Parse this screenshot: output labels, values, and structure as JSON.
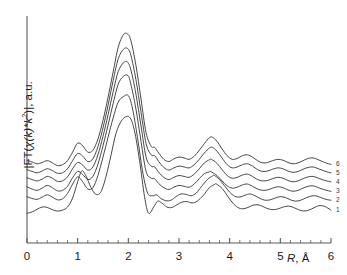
{
  "chart_data": {
    "type": "line",
    "title": "",
    "subtitle": "",
    "xlabel": "R, Å",
    "ylabel": "|FT(χ(k)*k²)|, a.u.",
    "xlim": [
      0,
      6
    ],
    "ylim": [
      0,
      1
    ],
    "grid": false,
    "legend_position": "right-inline",
    "xticks": [
      0,
      1,
      2,
      3,
      4,
      5,
      6
    ],
    "xtick_labels": [
      "0",
      "1",
      "2",
      "3",
      "4",
      "5",
      "6"
    ],
    "xminor_tick_step": 0.2,
    "yticks": [],
    "ytick_labels": [],
    "yaxis_values_shown": false,
    "line_color": "#333333",
    "line_width": 0.9,
    "axis_color": "#555555",
    "background": "#ffffff",
    "note": "Six vertically offset EXAFS Fourier-transform magnitude curves; dominant first-shell peak near R = 2.0 A and second-shell peak near R = 3.65 A",
    "series": [
      {
        "name": "6",
        "label": "6",
        "baseline_offset": 0.345,
        "peak1_R": 1.98,
        "peak1_height": 0.93,
        "peak2_R": 3.66,
        "peak2_height": 0.47,
        "x": [
          0.0,
          0.1,
          0.2,
          0.3,
          0.4,
          0.5,
          0.6,
          0.7,
          0.8,
          0.9,
          1.0,
          1.1,
          1.2,
          1.3,
          1.4,
          1.5,
          1.6,
          1.7,
          1.8,
          1.9,
          1.98,
          2.05,
          2.15,
          2.25,
          2.35,
          2.45,
          2.52,
          2.6,
          2.7,
          2.8,
          2.9,
          3.0,
          3.1,
          3.2,
          3.3,
          3.4,
          3.5,
          3.6,
          3.66,
          3.75,
          3.85,
          3.95,
          4.05,
          4.15,
          4.25,
          4.35,
          4.45,
          4.55,
          4.65,
          4.75,
          4.85,
          4.95,
          5.05,
          5.15,
          5.25,
          5.35,
          5.45,
          5.55,
          5.65,
          5.75,
          5.85,
          5.95,
          6.0
        ],
        "y": [
          0.368,
          0.36,
          0.352,
          0.358,
          0.366,
          0.356,
          0.344,
          0.348,
          0.366,
          0.404,
          0.444,
          0.432,
          0.404,
          0.412,
          0.462,
          0.545,
          0.648,
          0.76,
          0.87,
          0.925,
          0.93,
          0.9,
          0.79,
          0.64,
          0.49,
          0.43,
          0.425,
          0.4,
          0.372,
          0.362,
          0.374,
          0.382,
          0.378,
          0.372,
          0.386,
          0.412,
          0.442,
          0.468,
          0.47,
          0.452,
          0.418,
          0.388,
          0.372,
          0.376,
          0.388,
          0.392,
          0.382,
          0.366,
          0.356,
          0.358,
          0.366,
          0.372,
          0.368,
          0.358,
          0.352,
          0.356,
          0.366,
          0.376,
          0.378,
          0.37,
          0.36,
          0.352,
          0.35
        ]
      },
      {
        "name": "5",
        "label": "5",
        "baseline_offset": 0.312,
        "peak1_R": 1.98,
        "peak1_height": 0.865,
        "peak2_R": 3.66,
        "peak2_height": 0.425,
        "x": [
          0.0,
          0.1,
          0.2,
          0.3,
          0.4,
          0.5,
          0.6,
          0.7,
          0.8,
          0.9,
          1.0,
          1.1,
          1.2,
          1.3,
          1.4,
          1.5,
          1.6,
          1.7,
          1.8,
          1.9,
          1.98,
          2.05,
          2.15,
          2.25,
          2.35,
          2.45,
          2.52,
          2.6,
          2.7,
          2.8,
          2.9,
          3.0,
          3.1,
          3.2,
          3.3,
          3.4,
          3.5,
          3.6,
          3.66,
          3.75,
          3.85,
          3.95,
          4.05,
          4.15,
          4.25,
          4.35,
          4.45,
          4.55,
          4.65,
          4.75,
          4.85,
          4.95,
          5.05,
          5.15,
          5.25,
          5.35,
          5.45,
          5.55,
          5.65,
          5.75,
          5.85,
          5.95,
          6.0
        ],
        "y": [
          0.326,
          0.318,
          0.312,
          0.32,
          0.33,
          0.322,
          0.31,
          0.312,
          0.33,
          0.366,
          0.398,
          0.386,
          0.362,
          0.374,
          0.428,
          0.512,
          0.612,
          0.722,
          0.818,
          0.86,
          0.865,
          0.835,
          0.726,
          0.582,
          0.442,
          0.392,
          0.388,
          0.362,
          0.336,
          0.324,
          0.334,
          0.342,
          0.338,
          0.334,
          0.348,
          0.372,
          0.4,
          0.422,
          0.425,
          0.408,
          0.378,
          0.348,
          0.334,
          0.338,
          0.348,
          0.352,
          0.342,
          0.326,
          0.318,
          0.32,
          0.328,
          0.334,
          0.33,
          0.32,
          0.314,
          0.318,
          0.328,
          0.336,
          0.338,
          0.33,
          0.322,
          0.314,
          0.312
        ]
      },
      {
        "name": "4",
        "label": "4",
        "baseline_offset": 0.278,
        "peak1_R": 1.98,
        "peak1_height": 0.805,
        "peak2_R": 3.64,
        "peak2_height": 0.372,
        "x": [
          0.0,
          0.1,
          0.2,
          0.3,
          0.4,
          0.5,
          0.6,
          0.7,
          0.8,
          0.9,
          1.0,
          1.1,
          1.2,
          1.3,
          1.4,
          1.5,
          1.6,
          1.7,
          1.8,
          1.9,
          1.98,
          2.05,
          2.15,
          2.25,
          2.35,
          2.45,
          2.52,
          2.6,
          2.7,
          2.8,
          2.9,
          3.0,
          3.1,
          3.2,
          3.3,
          3.4,
          3.5,
          3.6,
          3.64,
          3.75,
          3.85,
          3.95,
          4.05,
          4.15,
          4.25,
          4.35,
          4.45,
          4.55,
          4.65,
          4.75,
          4.85,
          4.95,
          5.05,
          5.15,
          5.25,
          5.35,
          5.45,
          5.55,
          5.65,
          5.75,
          5.85,
          5.95,
          6.0
        ],
        "y": [
          0.29,
          0.282,
          0.276,
          0.284,
          0.296,
          0.288,
          0.274,
          0.276,
          0.294,
          0.33,
          0.358,
          0.346,
          0.324,
          0.338,
          0.392,
          0.474,
          0.57,
          0.672,
          0.762,
          0.8,
          0.805,
          0.77,
          0.662,
          0.52,
          0.382,
          0.342,
          0.338,
          0.314,
          0.292,
          0.282,
          0.292,
          0.3,
          0.296,
          0.292,
          0.306,
          0.33,
          0.356,
          0.37,
          0.372,
          0.354,
          0.326,
          0.3,
          0.288,
          0.292,
          0.302,
          0.306,
          0.296,
          0.282,
          0.276,
          0.278,
          0.286,
          0.292,
          0.288,
          0.278,
          0.272,
          0.276,
          0.286,
          0.294,
          0.296,
          0.288,
          0.28,
          0.274,
          0.272
        ]
      },
      {
        "name": "3",
        "label": "3",
        "baseline_offset": 0.236,
        "peak1_R": 1.99,
        "peak1_height": 0.745,
        "peak2_R": 3.62,
        "peak2_height": 0.318,
        "x": [
          0.0,
          0.1,
          0.2,
          0.3,
          0.4,
          0.5,
          0.6,
          0.7,
          0.8,
          0.9,
          1.0,
          1.1,
          1.2,
          1.3,
          1.4,
          1.5,
          1.6,
          1.7,
          1.8,
          1.9,
          1.99,
          2.05,
          2.15,
          2.25,
          2.35,
          2.45,
          2.52,
          2.6,
          2.7,
          2.8,
          2.9,
          3.0,
          3.1,
          3.2,
          3.3,
          3.4,
          3.5,
          3.6,
          3.62,
          3.75,
          3.85,
          3.95,
          4.05,
          4.15,
          4.25,
          4.35,
          4.45,
          4.55,
          4.65,
          4.75,
          4.85,
          4.95,
          5.05,
          5.15,
          5.25,
          5.35,
          5.45,
          5.55,
          5.65,
          5.75,
          5.85,
          5.95,
          6.0
        ],
        "y": [
          0.25,
          0.24,
          0.234,
          0.244,
          0.256,
          0.246,
          0.232,
          0.234,
          0.252,
          0.29,
          0.318,
          0.304,
          0.282,
          0.296,
          0.35,
          0.432,
          0.524,
          0.62,
          0.706,
          0.74,
          0.745,
          0.706,
          0.596,
          0.452,
          0.318,
          0.288,
          0.286,
          0.264,
          0.246,
          0.238,
          0.248,
          0.256,
          0.252,
          0.248,
          0.262,
          0.286,
          0.308,
          0.316,
          0.318,
          0.3,
          0.276,
          0.254,
          0.244,
          0.248,
          0.258,
          0.262,
          0.252,
          0.24,
          0.234,
          0.236,
          0.244,
          0.25,
          0.246,
          0.236,
          0.23,
          0.234,
          0.244,
          0.252,
          0.254,
          0.246,
          0.238,
          0.232,
          0.23
        ]
      },
      {
        "name": "2",
        "label": "2",
        "baseline_offset": 0.196,
        "peak1_R": 2.0,
        "peak1_height": 0.655,
        "peak2_R": 3.7,
        "peak2_height": 0.3,
        "x": [
          0.0,
          0.1,
          0.2,
          0.3,
          0.4,
          0.5,
          0.6,
          0.7,
          0.8,
          0.9,
          1.0,
          1.1,
          1.2,
          1.3,
          1.4,
          1.5,
          1.6,
          1.7,
          1.8,
          1.9,
          2.0,
          2.08,
          2.18,
          2.28,
          2.38,
          2.48,
          2.56,
          2.64,
          2.74,
          2.84,
          2.94,
          3.04,
          3.14,
          3.24,
          3.34,
          3.44,
          3.56,
          3.66,
          3.7,
          3.8,
          3.9,
          4.0,
          4.1,
          4.2,
          4.3,
          4.4,
          4.5,
          4.6,
          4.7,
          4.8,
          4.9,
          5.0,
          5.1,
          5.2,
          5.3,
          5.4,
          5.5,
          5.6,
          5.7,
          5.8,
          5.9,
          6.0
        ],
        "y": [
          0.206,
          0.198,
          0.194,
          0.204,
          0.214,
          0.204,
          0.192,
          0.196,
          0.22,
          0.262,
          0.294,
          0.272,
          0.24,
          0.246,
          0.3,
          0.382,
          0.47,
          0.556,
          0.626,
          0.65,
          0.655,
          0.6,
          0.47,
          0.32,
          0.222,
          0.21,
          0.214,
          0.198,
          0.188,
          0.19,
          0.206,
          0.218,
          0.216,
          0.21,
          0.222,
          0.25,
          0.282,
          0.298,
          0.3,
          0.282,
          0.254,
          0.226,
          0.208,
          0.204,
          0.212,
          0.218,
          0.21,
          0.198,
          0.19,
          0.192,
          0.2,
          0.206,
          0.202,
          0.192,
          0.186,
          0.19,
          0.2,
          0.208,
          0.21,
          0.202,
          0.194,
          0.19
        ]
      },
      {
        "name": "1",
        "label": "1",
        "baseline_offset": 0.152,
        "peak1_R": 2.02,
        "peak1_height": 0.56,
        "peak2_R": 3.74,
        "peak2_height": 0.262,
        "x": [
          0.0,
          0.1,
          0.2,
          0.3,
          0.4,
          0.5,
          0.6,
          0.7,
          0.8,
          0.9,
          1.0,
          1.08,
          1.16,
          1.26,
          1.36,
          1.46,
          1.56,
          1.66,
          1.76,
          1.88,
          2.02,
          2.12,
          2.22,
          2.32,
          2.4,
          2.5,
          2.58,
          2.66,
          2.76,
          2.86,
          2.96,
          3.06,
          3.16,
          3.26,
          3.36,
          3.48,
          3.6,
          3.7,
          3.74,
          3.86,
          3.96,
          4.06,
          4.16,
          4.26,
          4.36,
          4.46,
          4.56,
          4.66,
          4.76,
          4.86,
          4.96,
          5.06,
          5.16,
          5.26,
          5.36,
          5.46,
          5.56,
          5.66,
          5.76,
          5.86,
          5.96,
          6.0
        ],
        "y": [
          0.132,
          0.138,
          0.15,
          0.16,
          0.158,
          0.148,
          0.142,
          0.146,
          0.16,
          0.2,
          0.272,
          0.32,
          0.3,
          0.248,
          0.216,
          0.228,
          0.296,
          0.392,
          0.49,
          0.548,
          0.56,
          0.5,
          0.368,
          0.206,
          0.132,
          0.16,
          0.186,
          0.178,
          0.16,
          0.158,
          0.17,
          0.182,
          0.184,
          0.178,
          0.186,
          0.212,
          0.246,
          0.26,
          0.262,
          0.24,
          0.208,
          0.178,
          0.158,
          0.152,
          0.158,
          0.168,
          0.17,
          0.162,
          0.152,
          0.148,
          0.152,
          0.16,
          0.164,
          0.158,
          0.148,
          0.142,
          0.146,
          0.156,
          0.166,
          0.164,
          0.152,
          0.146
        ]
      }
    ],
    "curve_labels": [
      "6",
      "5",
      "4",
      "3",
      "2",
      "1"
    ]
  },
  "axes": {
    "ylabel_parts": {
      "prefix": "|FT(",
      "chi": "χ",
      "k1": "(k)*k",
      "sup": "2",
      "suffix": ")|, a.u."
    },
    "xlabel_parts": {
      "symbol": "R",
      "unit": ", Å"
    },
    "xtick_labels": [
      "0",
      "1",
      "2",
      "3",
      "4",
      "5",
      "6"
    ]
  },
  "curve_labels": [
    "6",
    "5",
    "4",
    "3",
    "2",
    "1"
  ]
}
